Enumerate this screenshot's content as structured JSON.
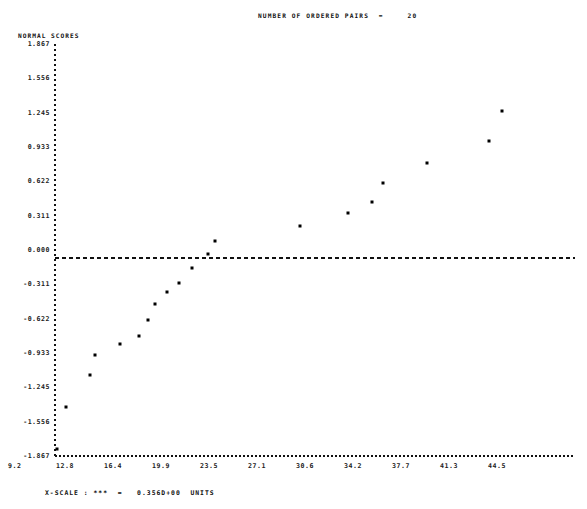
{
  "chart_data": {
    "type": "scatter",
    "title": "NUMBER OF ORDERED PAIRS  =     20",
    "ylabel": "NORMAL SCORES",
    "xlabel": "",
    "footer": "X-SCALE : ***  =   0.356D+00  UNITS",
    "grid": false,
    "legend": "none",
    "xlim": [
      9.2,
      46.3
    ],
    "ylim": [
      -1.867,
      1.867
    ],
    "xticks": [
      "9.2",
      "12.8",
      "16.4",
      "19.9",
      "23.5",
      "27.1",
      "30.6",
      "34.2",
      "37.7",
      "41.3",
      "44.5"
    ],
    "xtick_values": [
      9.2,
      12.8,
      16.4,
      19.9,
      23.5,
      27.1,
      30.6,
      34.2,
      37.7,
      41.3,
      44.5
    ],
    "yticks": [
      "1.867",
      "1.556",
      "1.245",
      "0.933",
      "0.622",
      "0.311",
      "0.000",
      "-0.311",
      "-0.622",
      "-0.933",
      "-1.245",
      "-1.556",
      "-1.867"
    ],
    "ytick_values": [
      1.867,
      1.556,
      1.245,
      0.933,
      0.622,
      0.311,
      0.0,
      -0.311,
      -0.622,
      -0.933,
      -1.245,
      -1.556,
      -1.867
    ],
    "zero_line": 0.0,
    "n_points": 20,
    "x": [
      9.6,
      11.0,
      11.6,
      13.8,
      14.4,
      15.0,
      15.6,
      16.3,
      17.4,
      18.0,
      19.3,
      20.0,
      21.6,
      24.3,
      26.8,
      28.5,
      29.4,
      32.5,
      35.4,
      38.4
    ],
    "y": [
      -1.867,
      -1.556,
      -1.245,
      -0.933,
      -0.862,
      -0.72,
      -0.622,
      -0.49,
      -0.37,
      -0.24,
      -0.11,
      0.0,
      0.17,
      0.311,
      0.43,
      0.56,
      0.622,
      0.933,
      1.245,
      1.64
    ],
    "points_px": [
      [
        57,
        449
      ],
      [
        66,
        407
      ],
      [
        90,
        375
      ],
      [
        95,
        355
      ],
      [
        120,
        344
      ],
      [
        139,
        336
      ],
      [
        148,
        320
      ],
      [
        155,
        304
      ],
      [
        167,
        292
      ],
      [
        179,
        283
      ],
      [
        192,
        268
      ],
      [
        208,
        254
      ],
      [
        215,
        241
      ],
      [
        300,
        226
      ],
      [
        348,
        213
      ],
      [
        372,
        202
      ],
      [
        383,
        183
      ],
      [
        427,
        163
      ],
      [
        489,
        141
      ],
      [
        502,
        111
      ]
    ]
  },
  "axes": {
    "y_axis_name": "normal-scores-axis",
    "x_axis_name": "value-axis",
    "zero_line_name": "zero-reference-line"
  }
}
